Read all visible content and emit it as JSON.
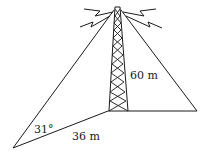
{
  "diagram": {
    "type": "geometry-figure",
    "labels": {
      "tower_height": "60 m",
      "angle": "31°",
      "ground_distance": "36 m"
    },
    "colors": {
      "line": "#1a1a1a",
      "background": "#ffffff"
    },
    "points": {
      "tower_top": [
        117,
        8
      ],
      "tower_base": [
        108,
        111
      ],
      "left_anchor": [
        13,
        148
      ],
      "right_anchor": [
        197,
        111
      ]
    }
  }
}
